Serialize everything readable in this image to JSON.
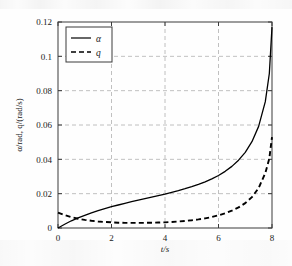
{
  "chart_data": {
    "type": "line",
    "title": "",
    "subtitle": "",
    "xlabel": "t/s",
    "ylabel": "α/rad, q/(rad/s)",
    "xlim": [
      0,
      8
    ],
    "ylim": [
      0,
      0.12
    ],
    "xticks": [
      0,
      2,
      4,
      6,
      8
    ],
    "yticks": [
      0,
      0.02,
      0.04,
      0.06,
      0.08,
      0.1,
      0.12
    ],
    "xtick_labels": [
      "0",
      "2",
      "4",
      "6",
      "8"
    ],
    "ytick_labels": [
      "0",
      "0.02",
      "0.04",
      "0.06",
      "0.08",
      "0.1",
      "0.12"
    ],
    "grid": true,
    "grid_style": "dashed",
    "grid_color": "#b0b0b0",
    "legend_position": "top-left-inside",
    "legend": [
      {
        "name": "α",
        "style": "solid",
        "color": "#000000"
      },
      {
        "name": "q",
        "style": "dashed",
        "color": "#000000"
      }
    ],
    "x": [
      0,
      0.25,
      0.5,
      0.75,
      1,
      1.25,
      1.5,
      1.75,
      2,
      2.25,
      2.5,
      2.75,
      3,
      3.25,
      3.5,
      3.75,
      4,
      4.25,
      4.5,
      4.75,
      5,
      5.25,
      5.5,
      5.75,
      6,
      6.25,
      6.5,
      6.75,
      7,
      7.25,
      7.5,
      7.75,
      7.9,
      8
    ],
    "series": [
      {
        "name": "α",
        "unit": "rad",
        "style": "solid",
        "color": "#000000",
        "values": [
          0,
          0.0022,
          0.0042,
          0.0059,
          0.0074,
          0.0088,
          0.0101,
          0.0113,
          0.0124,
          0.0134,
          0.0144,
          0.0153,
          0.0162,
          0.0171,
          0.018,
          0.0189,
          0.0198,
          0.0208,
          0.0218,
          0.0229,
          0.0241,
          0.0254,
          0.0269,
          0.0286,
          0.0306,
          0.033,
          0.0359,
          0.0395,
          0.0441,
          0.0503,
          0.0592,
          0.0736,
          0.09,
          0.117
        ]
      },
      {
        "name": "q",
        "unit": "rad/s",
        "style": "dashed",
        "color": "#000000",
        "values": [
          0.009,
          0.0075,
          0.0063,
          0.0054,
          0.0047,
          0.0042,
          0.0038,
          0.0035,
          0.0033,
          0.0031,
          0.003,
          0.003,
          0.003,
          0.003,
          0.0031,
          0.0032,
          0.0033,
          0.0035,
          0.0038,
          0.0041,
          0.0045,
          0.005,
          0.0056,
          0.0064,
          0.0074,
          0.0086,
          0.0101,
          0.012,
          0.0145,
          0.018,
          0.0233,
          0.032,
          0.0405,
          0.053
        ]
      }
    ],
    "annotations": {
      "crossover_t": 0.9,
      "q_minimum_t": 2.9,
      "q_minimum_value": 0.003
    }
  }
}
